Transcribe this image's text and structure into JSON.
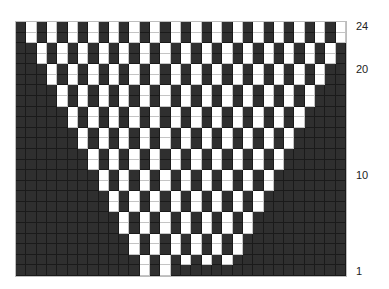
{
  "chart": {
    "columns": 32,
    "rows": 24,
    "colors": {
      "dark": "#2f2f2f",
      "light": "#ffffff"
    },
    "row_labels": [
      {
        "label": "24",
        "row": 24
      },
      {
        "label": "20",
        "row": 20
      },
      {
        "label": "10",
        "row": 10
      },
      {
        "label": "1",
        "row": 1
      }
    ],
    "light_cells_by_row": {
      "24": [
        1,
        3,
        5,
        7,
        9,
        11,
        13,
        15,
        17,
        19,
        21,
        23,
        25,
        27,
        29,
        31
      ],
      "23": [
        1,
        3,
        5,
        7,
        9,
        11,
        13,
        15,
        17,
        19,
        21,
        23,
        25,
        27,
        29,
        31
      ],
      "22": [
        2,
        4,
        6,
        8,
        10,
        12,
        14,
        16,
        18,
        20,
        22,
        24,
        26,
        28,
        30
      ],
      "21": [
        2,
        4,
        6,
        8,
        10,
        12,
        14,
        16,
        18,
        20,
        22,
        24,
        26,
        28,
        30
      ],
      "20": [
        3,
        5,
        7,
        9,
        11,
        13,
        15,
        17,
        19,
        21,
        23,
        25,
        27,
        29
      ],
      "19": [
        3,
        5,
        7,
        9,
        11,
        13,
        15,
        17,
        19,
        21,
        23,
        25,
        27,
        29
      ],
      "18": [
        4,
        6,
        8,
        10,
        12,
        14,
        16,
        18,
        20,
        22,
        24,
        26,
        28
      ],
      "17": [
        4,
        6,
        8,
        10,
        12,
        14,
        16,
        18,
        20,
        22,
        24,
        26,
        28
      ],
      "16": [
        5,
        7,
        9,
        11,
        13,
        15,
        17,
        19,
        21,
        23,
        25,
        27
      ],
      "15": [
        5,
        7,
        9,
        11,
        13,
        15,
        17,
        19,
        21,
        23,
        25,
        27
      ],
      "14": [
        6,
        8,
        10,
        12,
        14,
        16,
        18,
        20,
        22,
        24,
        26
      ],
      "13": [
        6,
        8,
        10,
        12,
        14,
        16,
        18,
        20,
        22,
        24,
        26
      ],
      "12": [
        7,
        9,
        11,
        13,
        15,
        17,
        19,
        21,
        23,
        25
      ],
      "11": [
        7,
        9,
        11,
        13,
        15,
        17,
        19,
        21,
        23,
        25
      ],
      "10": [
        8,
        10,
        12,
        14,
        16,
        18,
        20,
        22,
        24
      ],
      "9": [
        8,
        10,
        12,
        14,
        16,
        18,
        20,
        22,
        24
      ],
      "8": [
        9,
        11,
        13,
        15,
        17,
        19,
        21,
        23
      ],
      "7": [
        9,
        11,
        13,
        15,
        17,
        19,
        21,
        23
      ],
      "6": [
        10,
        12,
        14,
        16,
        18,
        20,
        22
      ],
      "5": [
        10,
        12,
        14,
        16,
        18,
        20,
        22
      ],
      "4": [
        11,
        13,
        15,
        17,
        19,
        21
      ],
      "3": [
        11,
        13,
        15,
        17,
        19,
        21
      ],
      "2": [
        12,
        14,
        16,
        18,
        20
      ],
      "1": [
        12,
        14
      ]
    }
  }
}
